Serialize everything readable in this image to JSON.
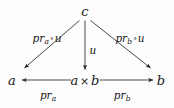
{
  "figure": {
    "kind": "commutative-diagram",
    "background_color": "#fdfdfd",
    "ink_color": "#1a1a1a",
    "nodes": [
      {
        "id": "c",
        "label": "c",
        "x": 85,
        "y": 11
      },
      {
        "id": "a",
        "label": "a",
        "x": 12,
        "y": 80
      },
      {
        "id": "axb",
        "label_parts": {
          "left": "a",
          "op": "×",
          "right": "b"
        },
        "label": "a × b",
        "x": 85,
        "y": 80
      },
      {
        "id": "b",
        "label": "b",
        "x": 161,
        "y": 80
      }
    ],
    "edges": [
      {
        "id": "c-to-a",
        "from": "c",
        "to": "a",
        "label_parts": {
          "base": "pr",
          "sub": "a",
          "op": "∘",
          "rest": "u"
        },
        "label": "prₐ ∘ u",
        "label_x": 47,
        "label_y": 38,
        "arrowhead": "end"
      },
      {
        "id": "c-to-axb",
        "from": "c",
        "to": "axb",
        "label_parts": {
          "base": "u"
        },
        "label": "u",
        "label_x": 93,
        "label_y": 50,
        "arrowhead": "end"
      },
      {
        "id": "c-to-b",
        "from": "c",
        "to": "b",
        "label_parts": {
          "base": "pr",
          "sub": "b",
          "op": "∘",
          "rest": "u"
        },
        "label": "prᵇ ∘ u",
        "label_x": 130,
        "label_y": 38,
        "arrowhead": "end"
      },
      {
        "id": "axb-to-a",
        "from": "axb",
        "to": "a",
        "label_parts": {
          "base": "pr",
          "sub": "a"
        },
        "label": "prₐ",
        "label_x": 48,
        "label_y": 95,
        "arrowhead": "end"
      },
      {
        "id": "axb-to-b",
        "from": "axb",
        "to": "b",
        "label_parts": {
          "base": "pr",
          "sub": "b"
        },
        "label": "prᵇ",
        "label_x": 122,
        "label_y": 95,
        "arrowhead": "end"
      }
    ]
  }
}
